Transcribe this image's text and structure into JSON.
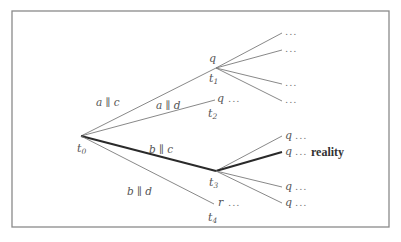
{
  "diagram": {
    "type": "branching-time-tree",
    "frame": {
      "x": 12,
      "y": 11,
      "width": 377,
      "height": 216
    },
    "nodes": {
      "t0": {
        "label": "t",
        "sub": "0",
        "x": 81,
        "y": 136
      },
      "t1": {
        "label": "t",
        "sub": "1",
        "x": 216,
        "y": 68,
        "state": "q"
      },
      "t2": {
        "label": "t",
        "sub": "2",
        "x": 215,
        "y": 100,
        "state": "q ..."
      },
      "t3": {
        "label": "t",
        "sub": "3",
        "x": 216,
        "y": 171
      },
      "t4": {
        "label": "t",
        "sub": "4",
        "x": 214,
        "y": 204,
        "state": "r ..."
      }
    },
    "edges": [
      {
        "from": "t0",
        "to": "t1",
        "label": "a ∥ c",
        "bold": false
      },
      {
        "from": "t0",
        "to": "t2",
        "label": "a ∥ d",
        "bold": false
      },
      {
        "from": "t0",
        "to": "t3",
        "label": "b ∥ c",
        "bold": true
      },
      {
        "from": "t0",
        "to": "t4",
        "label": "b ∥ d",
        "bold": false
      }
    ],
    "t1_leaves": [
      {
        "x": 282,
        "y": 33,
        "text": "..."
      },
      {
        "x": 282,
        "y": 50,
        "text": "..."
      },
      {
        "x": 282,
        "y": 84,
        "text": "..."
      },
      {
        "x": 282,
        "y": 101,
        "text": "..."
      }
    ],
    "t3_leaves": [
      {
        "x": 282,
        "y": 136,
        "text": "q ...",
        "bold": false
      },
      {
        "x": 282,
        "y": 152,
        "text": "q ...",
        "bold": true,
        "annotation": "reality"
      },
      {
        "x": 282,
        "y": 187,
        "text": "q ...",
        "bold": false
      },
      {
        "x": 282,
        "y": 203,
        "text": "q ...",
        "bold": false
      }
    ],
    "edge_labels": {
      "ac": "a ∥ c",
      "ad": "a ∥ d",
      "bc": "b ∥ c",
      "bd": "b ∥ d"
    },
    "texts": {
      "t1_state": "q",
      "t2_state": "q",
      "t4_state": "r",
      "dots": "...",
      "reality": "reality",
      "t_letter": "t",
      "sub0": "0",
      "sub1": "1",
      "sub2": "2",
      "sub3": "3",
      "sub4": "4",
      "q": "q"
    }
  }
}
